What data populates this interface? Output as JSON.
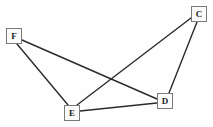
{
  "diagram": {
    "type": "node-link-graph",
    "background_color": "#fefefe",
    "node_fill_color": "#fbfbfb",
    "node_border_color": "#7a7a7a",
    "edge_color": "#2b2b2b",
    "label_color": "#1c1c1c",
    "nodes": [
      {
        "id": "F",
        "label": "F",
        "x": 6,
        "y": 28,
        "w": 16,
        "h": 16,
        "cx": 14,
        "cy": 36
      },
      {
        "id": "C",
        "label": "C",
        "x": 191,
        "y": 6,
        "w": 16,
        "h": 16,
        "cx": 199,
        "cy": 14
      },
      {
        "id": "E",
        "label": "E",
        "x": 64,
        "y": 105,
        "w": 16,
        "h": 16,
        "cx": 72,
        "cy": 113
      },
      {
        "id": "D",
        "label": "D",
        "x": 157,
        "y": 93,
        "w": 16,
        "h": 16,
        "cx": 165,
        "cy": 101
      }
    ],
    "edges": [
      {
        "id": "F-E",
        "from": "F",
        "to": "E",
        "x1": 17,
        "y1": 44,
        "x2": 68,
        "y2": 105
      },
      {
        "id": "F-D",
        "from": "F",
        "to": "D",
        "x1": 22,
        "y1": 40,
        "x2": 157,
        "y2": 99
      },
      {
        "id": "C-E",
        "from": "C",
        "to": "E",
        "x1": 191,
        "y1": 18,
        "x2": 77,
        "y2": 105
      },
      {
        "id": "C-D",
        "from": "C",
        "to": "D",
        "x1": 197,
        "y1": 22,
        "x2": 169,
        "y2": 93
      },
      {
        "id": "E-D",
        "from": "E",
        "to": "D",
        "x1": 80,
        "y1": 111,
        "x2": 157,
        "y2": 103
      }
    ]
  }
}
